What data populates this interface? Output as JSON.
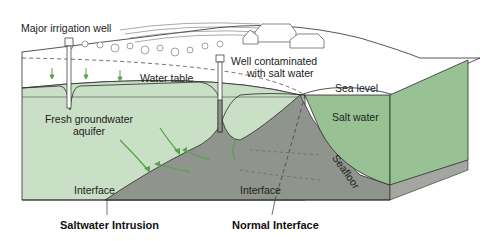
{
  "labels": {
    "major_irrigation_well": "Major irrigation well",
    "well_contaminated_line1": "Well contaminated",
    "well_contaminated_line2": "with salt water",
    "water_table": "Water table",
    "sea_level": "Sea level",
    "fresh_groundwater_line1": "Fresh groundwater",
    "fresh_groundwater_line2": "aquifer",
    "salt_water": "Salt water",
    "seafloor": "Seafloor",
    "interface_left": "Interface",
    "interface_right": "Interface"
  },
  "captions": {
    "left": "Saltwater Intrusion",
    "right": "Normal Interface"
  },
  "colors": {
    "fresh_water": "#c9dfc6",
    "salt_water_sea": "#98c293",
    "saltwater_wedge": "#8f948d",
    "base_layer": "#a3a6a1",
    "flow_arrows": "#5aa34e",
    "outline": "#2b2b2b"
  }
}
